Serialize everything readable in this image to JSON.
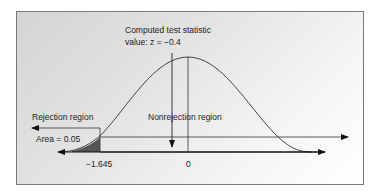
{
  "figure": {
    "annotation_line1": "Computed test statistic",
    "annotation_line2": "value: z = −0.4",
    "rejection_label": "Rejection region",
    "nonrejection_label": "Nonrejection region",
    "area_label": "Area = 0.05",
    "tick_critical": "−1.645",
    "tick_zero": "0",
    "colors": {
      "shade": "#555555",
      "line": "#222222",
      "panel_top": "#d4d4d4",
      "panel_bottom": "#ffffff"
    }
  }
}
